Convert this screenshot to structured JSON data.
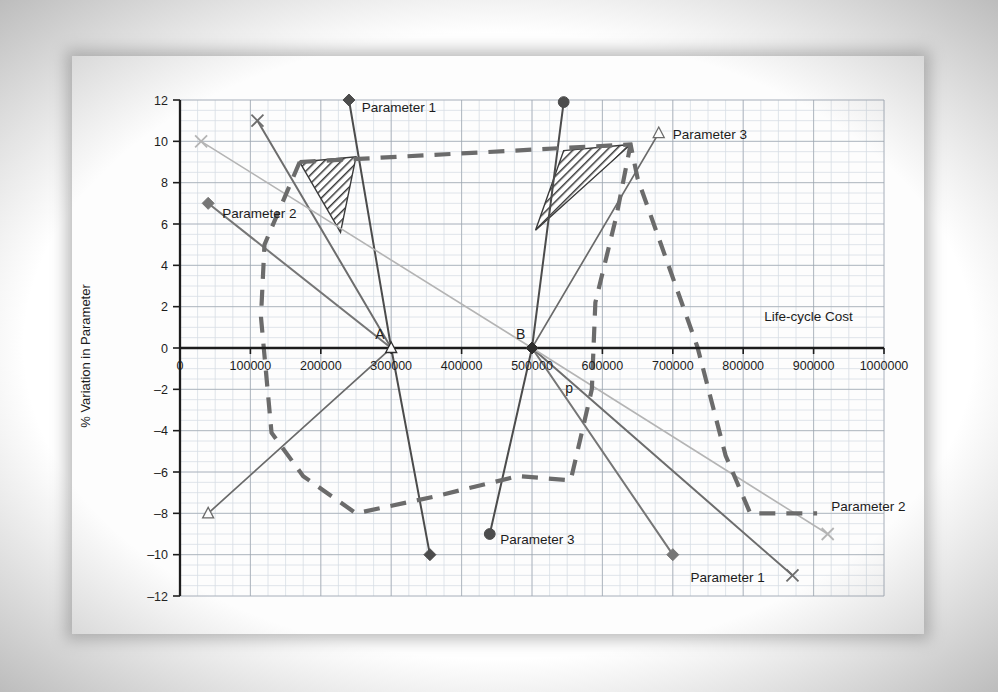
{
  "chart_data": {
    "type": "line",
    "title": "",
    "xlabel": "Life-cycle Cost",
    "ylabel": "% Variation in Parameter",
    "xlim": [
      0,
      1000000
    ],
    "ylim": [
      -12,
      12
    ],
    "xticks": [
      0,
      100000,
      200000,
      300000,
      400000,
      500000,
      600000,
      700000,
      800000,
      900000,
      1000000
    ],
    "xtick_labels": [
      "0",
      "100000",
      "200000",
      "300000",
      "400000",
      "500000",
      "600000",
      "700000",
      "800000",
      "900000",
      "1000000"
    ],
    "yticks": [
      -12,
      -10,
      -8,
      -6,
      -4,
      -2,
      0,
      2,
      4,
      6,
      8,
      10,
      12
    ],
    "ytick_labels": [
      "‒12",
      "‒10",
      "‒8",
      "‒6",
      "‒4",
      "‒2",
      "0",
      "2",
      "4",
      "6",
      "8",
      "10",
      "12"
    ],
    "grid": true,
    "grid_minor_step_x": 25000,
    "grid_minor_step_y": 0.5,
    "legend": "inline-labels",
    "series": [
      {
        "name": "Parameter 1 (solid, steep, through A)",
        "style": "solid",
        "color": "#4c4c4c",
        "width": 2.0,
        "marker": "diamond-filled",
        "points": [
          [
            240000,
            12
          ],
          [
            300000,
            0
          ],
          [
            355000,
            -10
          ]
        ]
      },
      {
        "name": "Parameter 1 (solid, long descending)",
        "style": "solid",
        "color": "#6d6d6d",
        "width": 2.0,
        "marker": "x",
        "points": [
          [
            110000,
            11
          ],
          [
            300000,
            0
          ],
          [
            500000,
            0
          ],
          [
            870000,
            -11
          ]
        ]
      },
      {
        "name": "Parameter 2 (solid, descending from 7)",
        "style": "solid",
        "color": "#767676",
        "width": 2.0,
        "marker": "diamond-filled",
        "points": [
          [
            40000,
            7
          ],
          [
            300000,
            0
          ],
          [
            500000,
            0
          ],
          [
            700000,
            -10
          ]
        ]
      },
      {
        "name": "Parameter 2 (light gray, 10 to -9)",
        "style": "solid",
        "color": "#b4b4b4",
        "width": 1.6,
        "marker": "x",
        "points": [
          [
            30000,
            10
          ],
          [
            500000,
            0
          ],
          [
            920000,
            -9
          ]
        ]
      },
      {
        "name": "Parameter 3 (solid, rising from -8)",
        "style": "solid",
        "color": "#6a6a6a",
        "width": 1.7,
        "marker": "triangle-open",
        "points": [
          [
            40000,
            -8
          ],
          [
            300000,
            0
          ],
          [
            500000,
            0
          ],
          [
            680000,
            10.4
          ]
        ]
      },
      {
        "name": "Parameter 3 (solid, steep through B)",
        "style": "solid",
        "color": "#4c4c4c",
        "width": 2.0,
        "marker": "circle-filled",
        "points": [
          [
            545000,
            11.9
          ],
          [
            500000,
            0
          ],
          [
            440000,
            -9
          ]
        ]
      },
      {
        "name": "Envelope (thick dashed upper/outer)",
        "style": "dashed",
        "color": "#6b6b6b",
        "width": 4.2,
        "marker": "none",
        "points": [
          [
            170000,
            9.0
          ],
          [
            640000,
            9.85
          ],
          [
            650000,
            8.2
          ],
          [
            735000,
            0.05
          ],
          [
            775000,
            -5.2
          ],
          [
            810000,
            -8.0
          ],
          [
            905000,
            -8.0
          ]
        ]
      },
      {
        "name": "Envelope (thick dashed lower/inner)",
        "style": "dashed",
        "color": "#6b6b6b",
        "width": 4.2,
        "marker": "none",
        "points": [
          [
            170000,
            9.0
          ],
          [
            120000,
            5.0
          ],
          [
            115000,
            1.5
          ],
          [
            130000,
            -4.1
          ],
          [
            175000,
            -6.2
          ],
          [
            250000,
            -8.0
          ],
          [
            360000,
            -7.2
          ],
          [
            480000,
            -6.2
          ],
          [
            555000,
            -6.4
          ],
          [
            585000,
            -2.0
          ],
          [
            590000,
            2.2
          ],
          [
            620000,
            6.4
          ],
          [
            640000,
            9.85
          ]
        ]
      }
    ],
    "hatched_regions": [
      {
        "name": "left-hatched-triangle",
        "vertices": [
          [
            170000,
            9.0
          ],
          [
            250000,
            9.25
          ],
          [
            228000,
            5.6
          ]
        ]
      },
      {
        "name": "right-hatched-triangle",
        "vertices": [
          [
            545000,
            9.55
          ],
          [
            640000,
            9.85
          ],
          [
            505000,
            5.7
          ]
        ]
      }
    ],
    "point_markers": [
      {
        "name": "point-A",
        "label": "A",
        "x": 300000,
        "y": 0,
        "marker": "triangle-open"
      },
      {
        "name": "point-B",
        "label": "B",
        "x": 500000,
        "y": 0,
        "marker": "diamond-filled"
      },
      {
        "name": "point-p",
        "label": "p",
        "x": 570000,
        "y": -2.6,
        "marker": "none"
      }
    ],
    "annotations": [
      {
        "name": "label-parameter-1-top",
        "text": "Parameter 1",
        "x": 258000,
        "y": 11.4
      },
      {
        "name": "label-parameter-2-left",
        "text": "Parameter 2",
        "x": 60000,
        "y": 6.3
      },
      {
        "name": "label-parameter-3-right",
        "text": "Parameter 3",
        "x": 700000,
        "y": 10.1
      },
      {
        "name": "label-parameter-3-bottom",
        "text": "Parameter 3",
        "x": 455000,
        "y": -9.5
      },
      {
        "name": "label-parameter-2-right",
        "text": "Parameter 2",
        "x": 925000,
        "y": -7.9
      },
      {
        "name": "label-parameter-1-bottom",
        "text": "Parameter 1",
        "x": 725000,
        "y": -11.3
      },
      {
        "name": "label-life-cycle-cost",
        "text": "Life-cycle Cost",
        "x": 830000,
        "y": 1.3
      }
    ]
  },
  "axis": {
    "x_title": "Life-cycle Cost",
    "y_title": "% Variation in Parameter"
  },
  "colors": {
    "ink": "#1c1c1c",
    "dark_line": "#4c4c4c",
    "mid_line": "#6d6d6d",
    "light_line": "#b4b4b4",
    "dashed": "#6b6b6b",
    "grid_minor": "#d7dde4",
    "grid_major": "#9aa3ad",
    "paper": "#fdfdfd"
  }
}
